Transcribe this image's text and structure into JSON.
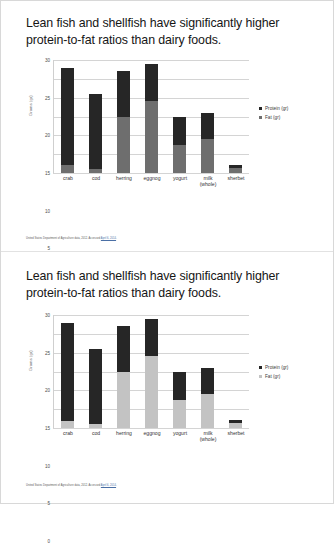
{
  "document": {
    "background_color": "#ffffff",
    "border_color": "#d8d8d8"
  },
  "slides": [
    {
      "title": "Lean fish and shellfish have significantly higher protein-to-fat ratios than dairy foods.",
      "source_prefix": "United States Department of Agriculture data, 2012. Accessed ",
      "source_link": "April 6, 2014",
      "source_suffix": "."
    },
    {
      "title": "Lean fish and shellfish have significantly higher protein-to-fat ratios than dairy foods.",
      "source_prefix": "United States Department of Agriculture data, 2012. Accessed ",
      "source_link": "April 6, 2014",
      "source_suffix": "."
    }
  ],
  "chart_data": [
    {
      "type": "bar",
      "stacked": true,
      "title": "",
      "xlabel": "",
      "ylabel": "Grams (gr)",
      "ylim": [
        0,
        30
      ],
      "yticks": [
        0,
        5,
        10,
        15,
        20,
        25,
        30
      ],
      "grid": true,
      "legend_position": "right",
      "categories": [
        "crab",
        "cod",
        "herring",
        "eggnog",
        "yogurt",
        "milk (whole)",
        "sherbet"
      ],
      "category_lines": [
        [
          "crab"
        ],
        [
          "cod"
        ],
        [
          "herring"
        ],
        [
          "eggnog"
        ],
        [
          "yogurt"
        ],
        [
          "milk",
          "(whole)"
        ],
        [
          "sherbet"
        ]
      ],
      "series": [
        {
          "name": "Fat (gr)",
          "color": "#6e6e6e",
          "values": [
            2,
            1,
            15,
            19,
            7.5,
            9,
            1.2
          ]
        },
        {
          "name": "Protein (gr)",
          "color": "#262626",
          "values": [
            26,
            20,
            12,
            10,
            7.5,
            7,
            0.8
          ]
        }
      ],
      "totals": [
        28,
        21,
        27,
        29,
        15,
        16,
        2
      ]
    },
    {
      "type": "bar",
      "stacked": true,
      "title": "",
      "xlabel": "",
      "ylabel": "Grams (gr)",
      "ylim": [
        0,
        30
      ],
      "yticks": [
        0,
        5,
        10,
        15,
        20,
        25,
        30
      ],
      "grid": true,
      "legend_position": "right",
      "categories": [
        "crab",
        "cod",
        "herring",
        "eggnog",
        "yogurt",
        "milk (whole)",
        "sherbet"
      ],
      "category_lines": [
        [
          "crab"
        ],
        [
          "cod"
        ],
        [
          "herring"
        ],
        [
          "eggnog"
        ],
        [
          "yogurt"
        ],
        [
          "milk",
          "(whole)"
        ],
        [
          "sherbet"
        ]
      ],
      "series": [
        {
          "name": "Fat (gr)",
          "color": "#c3c3c3",
          "values": [
            1.8,
            1,
            15,
            19,
            7.5,
            9,
            1.2
          ]
        },
        {
          "name": "Protein (gr)",
          "color": "#262626",
          "values": [
            26.2,
            20,
            12,
            10,
            7.5,
            7,
            0.8
          ]
        }
      ],
      "totals": [
        28,
        21,
        27,
        29,
        15,
        16,
        2
      ]
    }
  ]
}
